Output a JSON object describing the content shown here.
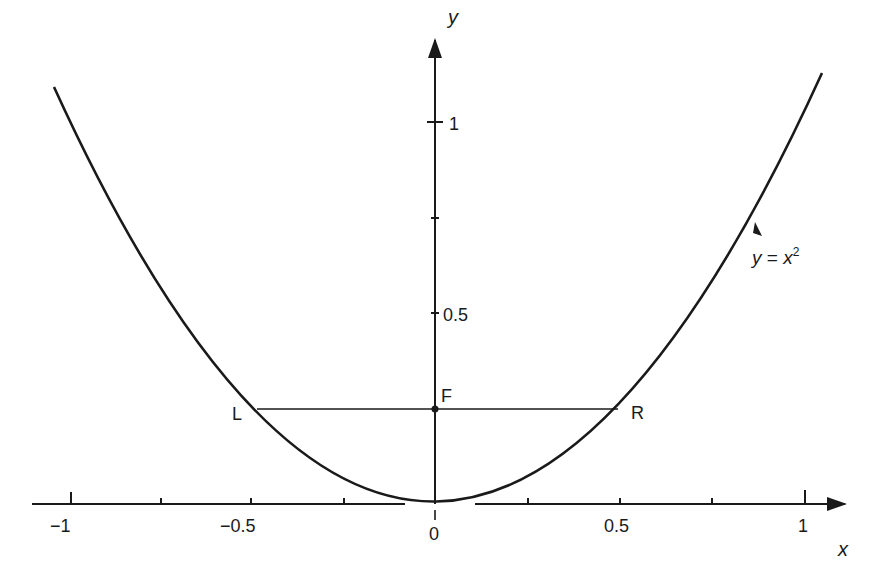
{
  "diagram": {
    "type": "parabola",
    "equation_label": {
      "y": "y",
      "eq": " = ",
      "x": "x",
      "exp": "2"
    },
    "axes": {
      "x_label": "x",
      "y_label": "y",
      "x_ticks": [
        {
          "value": -1,
          "label": "−1"
        },
        {
          "value": -0.75,
          "label": ""
        },
        {
          "value": -0.5,
          "label": "−0.5"
        },
        {
          "value": -0.25,
          "label": ""
        },
        {
          "value": 0,
          "label": "0"
        },
        {
          "value": 0.25,
          "label": ""
        },
        {
          "value": 0.5,
          "label": "0.5"
        },
        {
          "value": 0.75,
          "label": ""
        },
        {
          "value": 1,
          "label": "1"
        }
      ],
      "y_ticks": [
        {
          "value": 0.5,
          "label": "0.5"
        },
        {
          "value": 0.75,
          "label": ""
        },
        {
          "value": 1,
          "label": "1"
        }
      ]
    },
    "points": {
      "focus": {
        "label": "F",
        "x": 0,
        "y": 0.25
      },
      "left": {
        "label": "L",
        "x": -0.5,
        "y": 0.25
      },
      "right": {
        "label": "R",
        "x": 0.5,
        "y": 0.25
      }
    },
    "colors": {
      "ink": "#1a1a1a",
      "background": "#ffffff"
    }
  }
}
